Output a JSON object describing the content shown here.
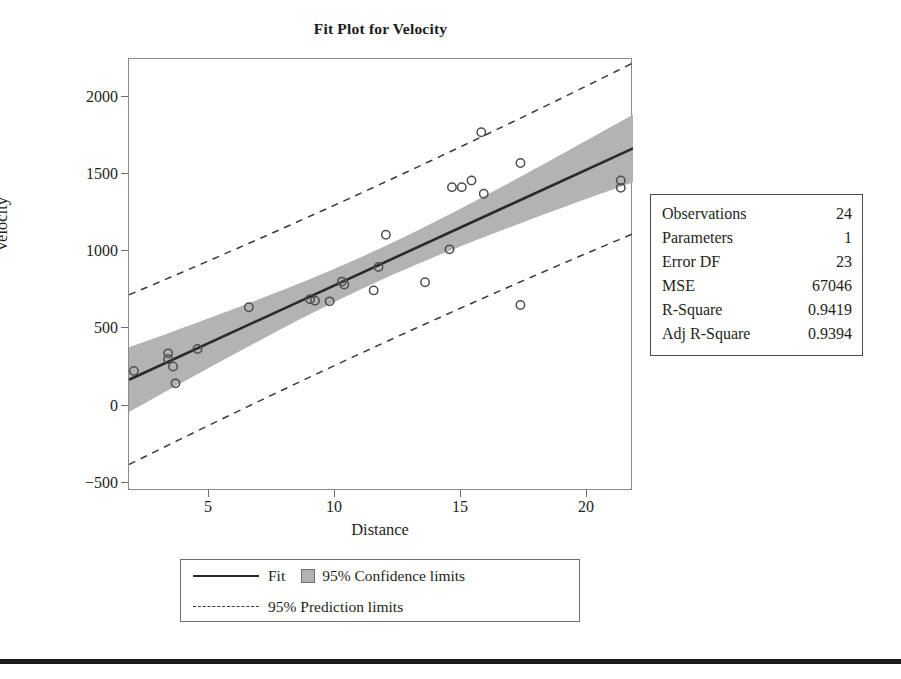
{
  "chart_data": {
    "type": "scatter",
    "title": "Fit Plot for Velocity",
    "xlabel": "Distance",
    "ylabel": "Velocity",
    "xlim": [
      1.8,
      22.4
    ],
    "ylim": [
      -650,
      2300
    ],
    "xticks": [
      5,
      10,
      15,
      20
    ],
    "yticks": [
      -500,
      0,
      500,
      1000,
      1500,
      2000
    ],
    "grid": false,
    "legend_position": "below-axes",
    "series": [
      {
        "name": "Observed data",
        "marker": "open-circle",
        "points": [
          [
            2.0,
            170
          ],
          [
            3.4,
            290
          ],
          [
            3.4,
            250
          ],
          [
            3.6,
            200
          ],
          [
            3.7,
            85
          ],
          [
            4.6,
            320
          ],
          [
            6.7,
            605
          ],
          [
            9.2,
            660
          ],
          [
            9.4,
            650
          ],
          [
            10.0,
            645
          ],
          [
            10.5,
            780
          ],
          [
            10.6,
            760
          ],
          [
            11.8,
            720
          ],
          [
            12.0,
            880
          ],
          [
            12.3,
            1100
          ],
          [
            13.9,
            775
          ],
          [
            14.9,
            1000
          ],
          [
            15.0,
            1425
          ],
          [
            15.4,
            1425
          ],
          [
            15.8,
            1470
          ],
          [
            16.2,
            1800
          ],
          [
            16.3,
            1380
          ],
          [
            17.8,
            1590
          ],
          [
            17.8,
            620
          ],
          [
            21.9,
            1470
          ],
          [
            21.9,
            1420
          ]
        ]
      },
      {
        "name": "Fit",
        "type": "line",
        "style": "solid",
        "endpoints": [
          [
            1.8,
            110
          ],
          [
            22.4,
            1690
          ]
        ]
      },
      {
        "name": "95% Confidence limits",
        "type": "band",
        "style": "filled",
        "color": "#b3b3b3"
      },
      {
        "name": "95% Prediction limits",
        "type": "band-outline",
        "style": "dashed"
      }
    ]
  },
  "plot": {
    "title": "Fit Plot for Velocity",
    "x_axis_label": "Distance",
    "y_axis_label": "Velocity",
    "x_tick_labels": [
      "5",
      "10",
      "15",
      "20"
    ],
    "y_tick_labels": [
      "2000",
      "1500",
      "1000",
      "500",
      "0",
      "−500"
    ]
  },
  "legend": {
    "fit_label": "Fit",
    "confidence_label": "95% Confidence limits",
    "prediction_label": "95% Prediction limits"
  },
  "stats": {
    "rows": [
      {
        "label": "Observations",
        "value": "24"
      },
      {
        "label": "Parameters",
        "value": "1"
      },
      {
        "label": "Error DF",
        "value": "23"
      },
      {
        "label": "MSE",
        "value": "67046"
      },
      {
        "label": "R-Square",
        "value": "0.9419"
      },
      {
        "label": "Adj R-Square",
        "value": "0.9394"
      }
    ]
  },
  "colors": {
    "fit_line": "#2a2a2a",
    "confidence_band": "#b3b3b3",
    "frame": "#8a8a8a",
    "marker": "#4d4d4d"
  }
}
